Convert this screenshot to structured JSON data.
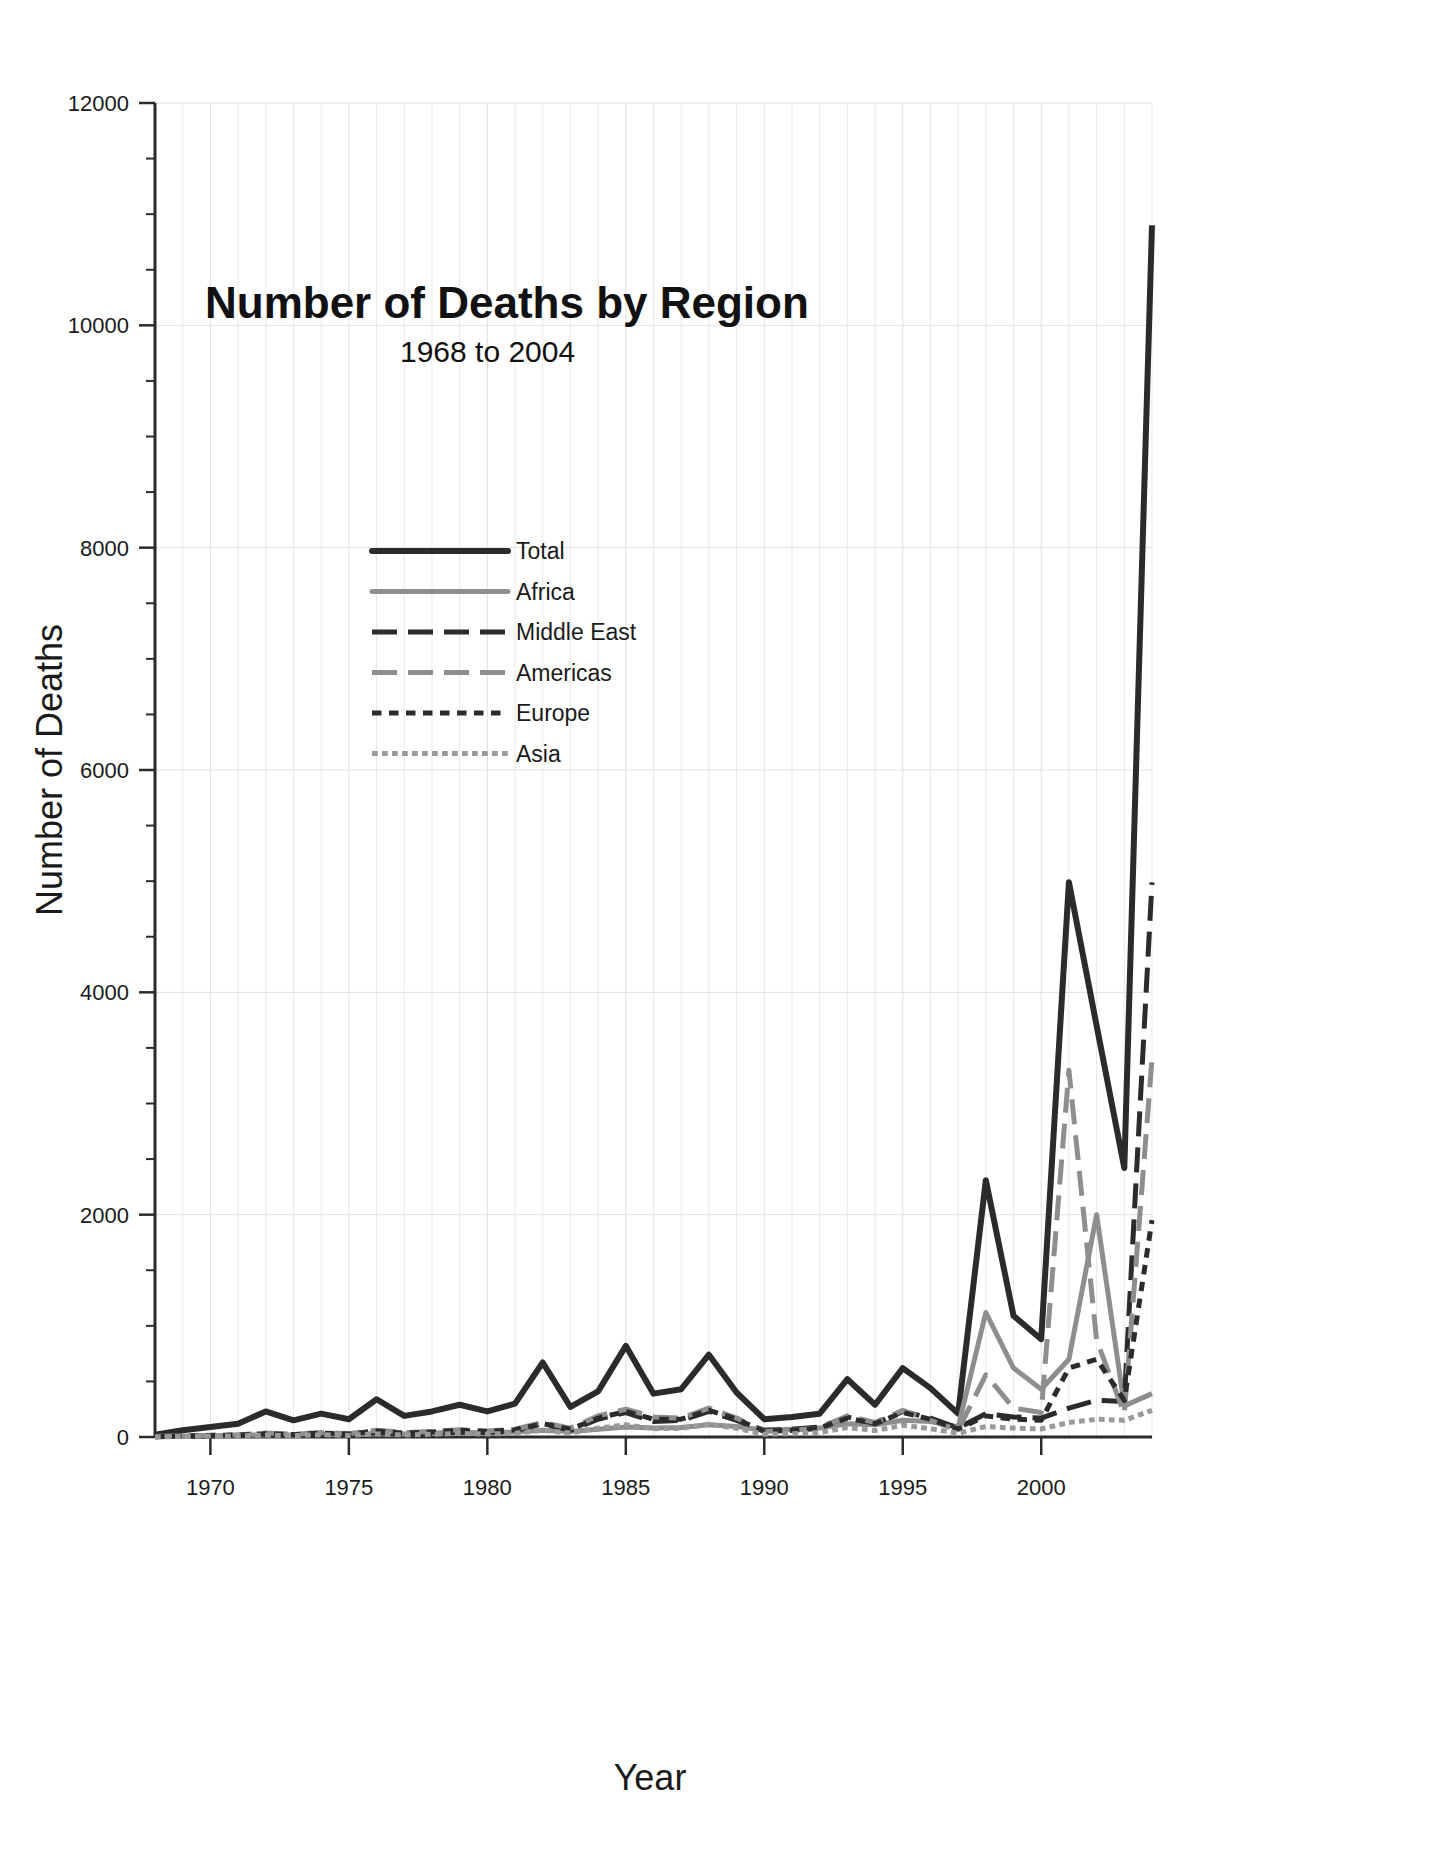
{
  "chart_data": {
    "type": "line",
    "title": "Number of Deaths by Region",
    "subtitle": "1968 to 2004",
    "xlabel": "Year",
    "ylabel": "Number of Deaths",
    "xlim": [
      1968,
      2004
    ],
    "ylim": [
      0,
      12000
    ],
    "grid": true,
    "legend_position": "upper-left-inside",
    "x_ticks": [
      1970,
      1975,
      1980,
      1985,
      1990,
      1995,
      2000
    ],
    "x_tick_labels": [
      "1970",
      "1975",
      "1980",
      "1985",
      "1990",
      "1995",
      "2000"
    ],
    "y_ticks": [
      0,
      2000,
      4000,
      6000,
      8000,
      10000,
      12000
    ],
    "y_tick_labels": [
      "0",
      "2000",
      "4000",
      "6000",
      "8000",
      "10000",
      "12000"
    ],
    "y_minor_tick_step": 500,
    "x": [
      1968,
      1969,
      1970,
      1971,
      1972,
      1973,
      1974,
      1975,
      1976,
      1977,
      1978,
      1979,
      1980,
      1981,
      1982,
      1983,
      1984,
      1985,
      1986,
      1987,
      1988,
      1989,
      1990,
      1991,
      1992,
      1993,
      1994,
      1995,
      1996,
      1997,
      1998,
      1999,
      2000,
      2001,
      2002,
      2003,
      2004
    ],
    "series": [
      {
        "name": "Total",
        "key": "total",
        "color": "#2b2b2b",
        "style": "solid",
        "width": 6,
        "values": [
          20,
          60,
          90,
          120,
          230,
          150,
          210,
          160,
          340,
          190,
          230,
          290,
          230,
          300,
          670,
          270,
          410,
          820,
          390,
          430,
          740,
          400,
          160,
          180,
          210,
          520,
          290,
          620,
          440,
          210,
          2310,
          1090,
          880,
          4990,
          3700,
          2420,
          10900
        ]
      },
      {
        "name": "Africa",
        "key": "africa",
        "color": "#8e8e8e",
        "style": "solid",
        "width": 5,
        "values": [
          5,
          8,
          12,
          15,
          20,
          18,
          25,
          20,
          30,
          28,
          35,
          40,
          38,
          45,
          60,
          50,
          70,
          90,
          80,
          85,
          110,
          95,
          60,
          70,
          80,
          120,
          110,
          150,
          140,
          90,
          1120,
          620,
          430,
          700,
          2000,
          280,
          390
        ]
      },
      {
        "name": "Middle East",
        "key": "middle_east",
        "color": "#2b2b2b",
        "style": "dashed-long",
        "width": 5,
        "values": [
          3,
          6,
          10,
          14,
          20,
          16,
          24,
          18,
          40,
          25,
          30,
          45,
          40,
          55,
          120,
          60,
          160,
          220,
          140,
          150,
          230,
          150,
          60,
          70,
          90,
          180,
          120,
          230,
          170,
          80,
          210,
          180,
          170,
          260,
          330,
          320,
          4990
        ]
      },
      {
        "name": "Americas",
        "key": "americas",
        "color": "#8e8e8e",
        "style": "dashed-long",
        "width": 5,
        "values": [
          4,
          10,
          15,
          20,
          35,
          25,
          40,
          30,
          60,
          40,
          50,
          65,
          55,
          70,
          130,
          80,
          190,
          250,
          180,
          170,
          260,
          170,
          50,
          60,
          80,
          190,
          130,
          240,
          150,
          60,
          560,
          260,
          220,
          3300,
          870,
          210,
          3400
        ]
      },
      {
        "name": "Europe",
        "key": "europe",
        "color": "#2b2b2b",
        "style": "dotted",
        "width": 5,
        "values": [
          3,
          8,
          14,
          18,
          30,
          22,
          35,
          26,
          55,
          35,
          45,
          60,
          50,
          65,
          120,
          70,
          170,
          230,
          160,
          160,
          240,
          160,
          50,
          60,
          80,
          170,
          120,
          220,
          160,
          70,
          190,
          160,
          150,
          620,
          700,
          330,
          1950
        ]
      },
      {
        "name": "Asia",
        "key": "asia",
        "color": "#9a9a9a",
        "style": "fine-dotted",
        "width": 5,
        "values": [
          2,
          4,
          8,
          10,
          16,
          12,
          20,
          14,
          28,
          18,
          24,
          32,
          26,
          34,
          60,
          36,
          80,
          110,
          75,
          78,
          115,
          78,
          25,
          30,
          40,
          85,
          58,
          105,
          75,
          33,
          95,
          80,
          72,
          130,
          160,
          150,
          240
        ]
      }
    ]
  },
  "axes": {
    "plot_left": 155,
    "plot_right": 1152,
    "plot_top": 103,
    "plot_bottom": 1437
  }
}
